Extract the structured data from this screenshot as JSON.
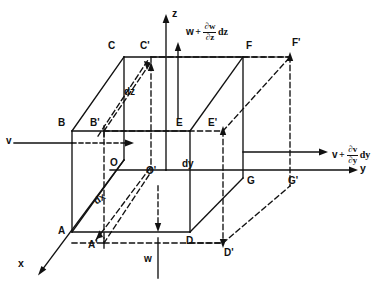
{
  "figure": {
    "kind": "line-diagram",
    "colors": {
      "ink": "#111111",
      "background": "#ffffff"
    }
  },
  "axes": [
    {
      "name": "z-axis",
      "label": "z",
      "direction": "up"
    },
    {
      "name": "y-axis",
      "label": "y",
      "direction": "right"
    },
    {
      "name": "x-axis",
      "label": "x",
      "direction": "down-left"
    }
  ],
  "vertices": [
    {
      "name": "vertex-C",
      "label": "C"
    },
    {
      "name": "vertex-C-prime",
      "label": "C'"
    },
    {
      "name": "vertex-F",
      "label": "F"
    },
    {
      "name": "vertex-F-prime",
      "label": "F'"
    },
    {
      "name": "vertex-B",
      "label": "B"
    },
    {
      "name": "vertex-B-prime",
      "label": "B'"
    },
    {
      "name": "vertex-E",
      "label": "E"
    },
    {
      "name": "vertex-E-prime",
      "label": "E'"
    },
    {
      "name": "vertex-O",
      "label": "O"
    },
    {
      "name": "vertex-O-prime",
      "label": "O'"
    },
    {
      "name": "vertex-G",
      "label": "G"
    },
    {
      "name": "vertex-G-prime",
      "label": "G'"
    },
    {
      "name": "vertex-A",
      "label": "A"
    },
    {
      "name": "vertex-A-prime",
      "label": "A'"
    },
    {
      "name": "vertex-D",
      "label": "D"
    },
    {
      "name": "vertex-D-prime",
      "label": "D'"
    }
  ],
  "dimensions": [
    {
      "name": "dimension-dz",
      "label": "dz"
    },
    {
      "name": "dimension-dx",
      "label": "dx"
    },
    {
      "name": "dimension-dy",
      "label": "dy"
    }
  ],
  "annotations": {
    "top_flux": {
      "name": "flux-top",
      "base": "w",
      "operator": "+",
      "numerator": "∂w",
      "denominator": "∂z",
      "differential": "dz",
      "plain": "w + ∂w/∂z dz"
    },
    "right_flux": {
      "name": "flux-right",
      "base": "v",
      "operator": "+",
      "numerator": "∂v",
      "denominator": "∂y",
      "differential": "dy",
      "plain": "v + ∂v/∂y dy"
    },
    "left_flux": {
      "name": "flux-left",
      "label": "v"
    },
    "bottom_flux": {
      "name": "flux-bottom",
      "label": "w"
    }
  }
}
